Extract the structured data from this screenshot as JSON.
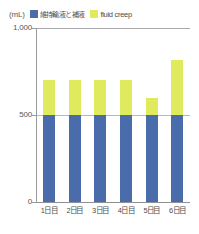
{
  "chart_data": {
    "type": "bar",
    "stacked": true,
    "title": "",
    "subtitle": "",
    "xlabel": "",
    "ylabel": "(mL)",
    "unit_label": "(mL)",
    "categories": [
      "1日目",
      "2日目",
      "3日目",
      "4日目",
      "5日目",
      "6日目"
    ],
    "series": [
      {
        "name": "維持輸液と補液",
        "color": "#4a6cab",
        "values": [
          500,
          500,
          500,
          500,
          500,
          500
        ]
      },
      {
        "name": "fluid creep",
        "color": "#dfeb5c",
        "values": [
          200,
          200,
          200,
          200,
          100,
          315
        ]
      }
    ],
    "totals": [
      700,
      700,
      700,
      700,
      600,
      815
    ],
    "ylim": [
      0,
      1000
    ],
    "yticks": [
      0,
      500,
      1000
    ],
    "ytick_labels": [
      "0",
      "500",
      "1,000"
    ],
    "grid": true,
    "legend_position": "top"
  },
  "legend": {
    "items": [
      {
        "label": "維持輸液と補液",
        "color": "#4a6cab"
      },
      {
        "label": "fluid creep",
        "color": "#dfeb5c"
      }
    ]
  },
  "axes": {
    "unit": "(mL)",
    "y_labels": [
      "1,000",
      "500",
      "0"
    ],
    "x_labels": [
      "1日目",
      "2日目",
      "3日目",
      "4日目",
      "5日目",
      "6日目"
    ]
  }
}
